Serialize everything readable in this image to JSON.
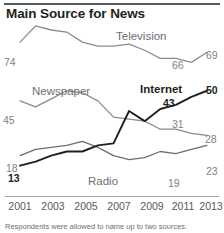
{
  "header": {
    "title": "Main Source for News"
  },
  "footnote": {
    "text": "Respondents were allowed to name up to two sources."
  },
  "colors": {
    "television": "#8c8c8c",
    "newspaper": "#8c8c8c",
    "internet": "#231f20",
    "radio": "#6d6e71",
    "title": "#231f20",
    "axis": "#a7a9ac",
    "rule": "#58595b"
  },
  "chart_data": {
    "type": "line",
    "title": "Main Source for News",
    "xlabel": "",
    "ylabel": "",
    "x": [
      2001,
      2002,
      2003,
      2004,
      2005,
      2006,
      2007,
      2008,
      2009,
      2010,
      2011,
      2012,
      2013
    ],
    "xticks": [
      "2001",
      "2003",
      "2005",
      "2007",
      "2009",
      "2011",
      "2013"
    ],
    "ylim": [
      0,
      80
    ],
    "grid": false,
    "legend": "inline",
    "series": [
      {
        "name": "Television",
        "color": "#8c8c8c",
        "values": [
          74,
          82,
          80,
          79,
          74,
          72,
          72,
          73,
          70,
          66,
          66,
          64,
          69
        ],
        "labels": [
          {
            "x": 2001,
            "value": 74,
            "text": "74"
          },
          {
            "x": 2011,
            "value": 66,
            "text": "66"
          },
          {
            "x": 2013,
            "value": 69,
            "text": "69"
          }
        ]
      },
      {
        "name": "Newspaper",
        "color": "#8c8c8c",
        "values": [
          45,
          42,
          46,
          50,
          49,
          45,
          37,
          36,
          35,
          31,
          31,
          29,
          28
        ],
        "labels": [
          {
            "x": 2001,
            "value": 45,
            "text": "45"
          },
          {
            "x": 2011,
            "value": 31,
            "text": "31"
          },
          {
            "x": 2013,
            "value": 28,
            "text": "28"
          }
        ]
      },
      {
        "name": "Internet",
        "color": "#231f20",
        "values": [
          13,
          15,
          18,
          20,
          20,
          23,
          24,
          40,
          35,
          41,
          43,
          47,
          50
        ],
        "labels": [
          {
            "x": 2001,
            "value": 13,
            "text": "13"
          },
          {
            "x": 2011,
            "value": 43,
            "text": "43"
          },
          {
            "x": 2013,
            "value": 50,
            "text": "50"
          }
        ]
      },
      {
        "name": "Radio",
        "color": "#6d6e71",
        "values": [
          18,
          21,
          22,
          23,
          25,
          22,
          18,
          16,
          17,
          20,
          19,
          21,
          23
        ],
        "labels": [
          {
            "x": 2001,
            "value": 18,
            "text": "18"
          },
          {
            "x": 2011,
            "value": 19,
            "text": "19"
          },
          {
            "x": 2013,
            "value": 23,
            "text": "23"
          }
        ]
      }
    ],
    "series_labels": [
      {
        "name": "Television",
        "text": "Television",
        "style": "light"
      },
      {
        "name": "Newspaper",
        "text": "Newspaper",
        "style": "light"
      },
      {
        "name": "Internet",
        "text": "Internet",
        "style": "dark"
      },
      {
        "name": "Radio",
        "text": "Radio",
        "style": "light"
      }
    ]
  },
  "value_labels": {
    "tv_start": "74",
    "tv_mid": "66",
    "tv_end": "69",
    "np_start": "45",
    "np_mid": "31",
    "np_end": "28",
    "net_start": "13",
    "net_mid": "43",
    "net_end": "50",
    "radio_start": "18",
    "radio_mid": "19",
    "radio_end": "23"
  },
  "series_names": {
    "television": "Television",
    "newspaper": "Newspaper",
    "internet": "Internet",
    "radio": "Radio"
  },
  "xticks": {
    "t1": "2001",
    "t2": "2003",
    "t3": "2005",
    "t4": "2007",
    "t5": "2009",
    "t6": "2011",
    "t7": "2013"
  }
}
